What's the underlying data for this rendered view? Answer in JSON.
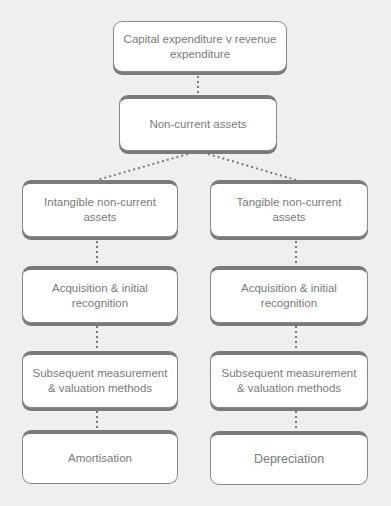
{
  "diagram": {
    "title_box": "Capital expenditure v revenue expenditure",
    "root": "Non-current assets",
    "branches": [
      {
        "name": "intangible",
        "nodes": [
          "Intangible non-current assets",
          "Acquisition & initial recognition",
          "Subsequent measurement & valuation methods",
          "Amortisation"
        ]
      },
      {
        "name": "tangible",
        "nodes": [
          "Tangible non-current assets",
          "Acquisition & initial recognition",
          "Subsequent measurement & valuation methods",
          "Depreciation"
        ]
      }
    ],
    "colors": {
      "background": "#efefef",
      "box_fill": "#ffffff",
      "box_border": "#8a8a8a",
      "text": "#7a7a7a",
      "connector": "#7a7a7a"
    }
  }
}
